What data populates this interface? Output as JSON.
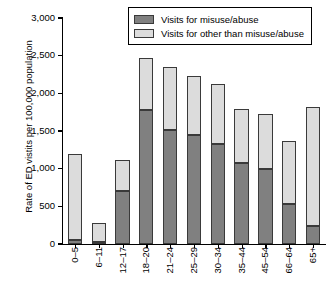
{
  "chart_data": {
    "type": "bar",
    "subtype": "stacked-vertical",
    "title": "",
    "xlabel": "",
    "ylabel": "Rate of ED vistits per 100,000 population",
    "ylim": [
      0,
      3000
    ],
    "ytick_values": [
      3000,
      2500,
      2000,
      1500,
      1000,
      500,
      0
    ],
    "ytick_labels": [
      "3,000",
      "2,500",
      "2,000",
      "1,500",
      "1,000",
      "500",
      "0"
    ],
    "grid": false,
    "legend_position": "top-center",
    "categories": [
      "0–5",
      "6–11",
      "12–17",
      "18–20",
      "21–24",
      "25–29",
      "30–34",
      "35–44",
      "45–54",
      "66–64",
      "65+"
    ],
    "series": [
      {
        "name": "Visits for misuse/abuse",
        "color": "#808080",
        "values": [
          50,
          30,
          710,
          1780,
          1510,
          1450,
          1330,
          1070,
          1000,
          530,
          240
        ]
      },
      {
        "name": "Visits for other than misuse/abuse",
        "color": "#dcdcdc",
        "values": [
          1140,
          250,
          410,
          690,
          840,
          780,
          790,
          720,
          720,
          840,
          1580
        ]
      }
    ],
    "totals": [
      1190,
      280,
      1120,
      2470,
      2350,
      2230,
      2120,
      1790,
      1720,
      1370,
      1820
    ]
  },
  "legend": {
    "entries": [
      {
        "label": "Visits for misuse/abuse",
        "swatch": "dark-gray-swatch"
      },
      {
        "label": "Visits for other than misuse/abuse",
        "swatch": "light-gray-swatch"
      }
    ]
  },
  "colors": {
    "misuse_abuse": "#808080",
    "other_than_misuse_abuse": "#dcdcdc",
    "bar_outline": "#3a3a3a",
    "axis": "#000000",
    "background": "#ffffff"
  }
}
